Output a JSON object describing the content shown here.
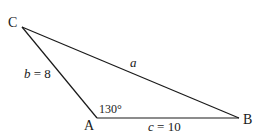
{
  "diagram": {
    "type": "triangle",
    "vertices": {
      "A": {
        "label": "A",
        "x": 97,
        "y": 118
      },
      "B": {
        "label": "B",
        "x": 239,
        "y": 118
      },
      "C": {
        "label": "C",
        "x": 22,
        "y": 27
      }
    },
    "sides": {
      "a": {
        "var": "a",
        "eq": "",
        "value": ""
      },
      "b": {
        "var": "b",
        "eq": " = ",
        "value": "8"
      },
      "c": {
        "var": "c",
        "eq": " = ",
        "value": "10"
      }
    },
    "angle_A": {
      "label": "130°"
    },
    "line_color": "#1a1a1a"
  }
}
